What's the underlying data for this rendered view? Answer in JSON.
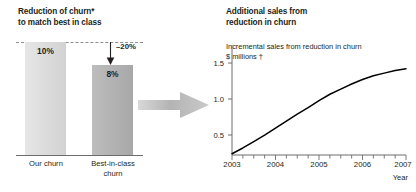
{
  "left": {
    "title": "Reduction of churn*\nto match best in class",
    "bars": [
      {
        "key": "our",
        "label": "10%",
        "value": 10,
        "category": "Our churn",
        "color": "#dcdcdc"
      },
      {
        "key": "best",
        "label": "8%",
        "value": 8,
        "category": "Best-in-class\nchurn",
        "color": "#b3b3b3"
      }
    ],
    "delta_label": "–20%",
    "reference_line_value": 10
  },
  "flow": {
    "arrow_icon": "arrow-right-icon",
    "color": "#b0b0b0"
  },
  "right": {
    "title": "Additional sales from\nreduction in churn",
    "subtitle": "Incremental sales from reduction in churn\n$ millions †",
    "axis_caption": "Year"
  },
  "chart_data": [
    {
      "type": "bar",
      "title": "Reduction of churn* to match best in class",
      "categories": [
        "Our churn",
        "Best-in-class churn"
      ],
      "values": [
        10,
        8
      ],
      "value_labels": [
        "10%",
        "8%"
      ],
      "annotation": "–20%",
      "xlabel": "",
      "ylabel": "",
      "ylim": [
        0,
        13.6
      ],
      "grid": false,
      "legend": "none",
      "colors": [
        "#dcdcdc",
        "#b3b3b3"
      ]
    },
    {
      "type": "line",
      "title": "Additional sales from reduction in churn",
      "subtitle": "Incremental sales from reduction in churn, $ millions †",
      "x": [
        2003,
        2003.25,
        2003.5,
        2003.75,
        2004,
        2004.25,
        2004.5,
        2004.75,
        2005,
        2005.25,
        2005.5,
        2005.75,
        2006,
        2006.25,
        2006.5,
        2006.75,
        2007
      ],
      "values": [
        0.02,
        0.11,
        0.21,
        0.31,
        0.42,
        0.53,
        0.64,
        0.74,
        0.85,
        0.95,
        1.03,
        1.11,
        1.18,
        1.24,
        1.28,
        1.32,
        1.35
      ],
      "xlabel": "Year",
      "ylabel": "$ millions",
      "xticks": [
        "2003",
        "2004",
        "2005",
        "2006",
        "2007"
      ],
      "yticks": [
        "0.5",
        "1.0",
        "1.5"
      ],
      "ytick_values": [
        0.5,
        1.0,
        1.5
      ],
      "xlim": [
        2003,
        2007
      ],
      "ylim": [
        0,
        1.72
      ],
      "grid": false,
      "legend": "none",
      "line_color": "#000000"
    }
  ]
}
